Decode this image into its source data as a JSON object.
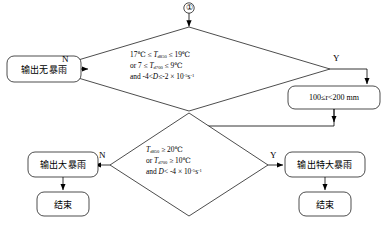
{
  "diagram": {
    "start_marker": "①",
    "line_color": "#000000",
    "fill_color": "#ffffff"
  },
  "nodes": {
    "decision1": {
      "name": "condition-diamond-1",
      "lines": [
        "17℃ ≤ T<sub>d850</sub> ≤ 19℃",
        "or 7 ≤ T<sub>d700</sub> ≤ 9℃",
        "and -4 < D ≤ -2 × 10<sup>-5</sup>s<sup>-1</sup>"
      ],
      "line1_plain": "17℃≤Td850≤19℃",
      "line2_plain": "or 7≤Td700≤9℃",
      "line3_plain": "and -4<D≤-2 × 10-5s-1"
    },
    "decision2": {
      "name": "condition-diamond-2",
      "lines": [
        "T<sub>d850</sub> ≥ 20℃",
        "or T<sub>d700</sub> ≥ 10℃",
        "and D < -4 × 10<sup>-5</sup>s<sup>-1</sup>"
      ],
      "line1_plain": "Td850≥20℃",
      "line2_plain": "or Td700≥10℃",
      "line3_plain": "and D<-4 × 10-5s-1"
    },
    "output_no_storm": "输出无暴雨",
    "rain_range": "100≤r<200 mm",
    "output_heavy_storm": "输出大暴雨",
    "output_extreme_storm": "输出特大暴雨",
    "end_left": "结束",
    "end_right": "结束"
  },
  "branches": {
    "d1_no": "N",
    "d1_yes": "Y",
    "d2_no": "N",
    "d2_yes": "Y"
  }
}
